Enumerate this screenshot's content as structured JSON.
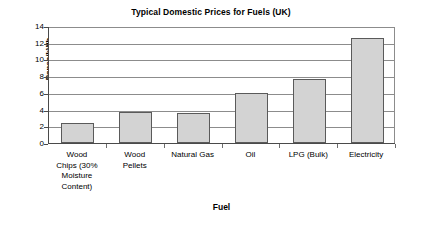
{
  "chart_data": {
    "type": "bar",
    "title": "Typical Domestic Prices for Fuels (UK)",
    "xlabel": "Fuel",
    "ylabel": "Pence/kWh",
    "categories": [
      "Wood Chips (30% Moisture Content)",
      "Wood Pellets",
      "Natural Gas",
      "Oil",
      "LPG (Bulk)",
      "Electricity"
    ],
    "category_lines": [
      [
        "Wood",
        "Chips (30%",
        "Moisture",
        "Content)"
      ],
      [
        "Wood",
        "Pellets"
      ],
      [
        "Natural Gas"
      ],
      [
        "Oil"
      ],
      [
        "LPG (Bulk)"
      ],
      [
        "Electricity"
      ]
    ],
    "values": [
      2.35,
      3.75,
      3.6,
      6.0,
      7.7,
      12.6
    ],
    "ylim": [
      0,
      14
    ],
    "yticks": [
      0,
      2,
      4,
      6,
      8,
      10,
      12,
      14
    ],
    "ytick_labels": [
      "0",
      "2",
      "4",
      "6",
      "8",
      "10",
      "12",
      "14"
    ],
    "grid": true,
    "grid_axis": "y",
    "legend": false,
    "bar_fill_color": "#d3d3d3",
    "bar_border_color": "#5a5a5a",
    "axis_color": "#4a4a4a",
    "grid_color": "#8c8c8c",
    "background_color": "#ffffff"
  }
}
